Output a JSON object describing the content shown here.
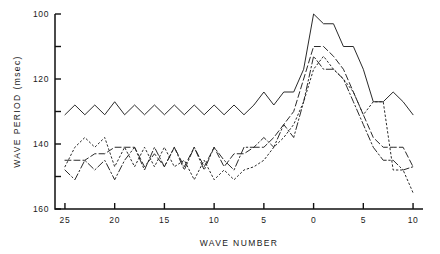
{
  "chart_data": {
    "type": "line",
    "title": "",
    "xlabel": "WAVE NUMBER",
    "ylabel": "WAVE PERIOD (msec)",
    "x_tick_labels": [
      "25",
      "20",
      "15",
      "10",
      "5",
      "0",
      "5",
      "10"
    ],
    "x_tick_values": [
      -25,
      -20,
      -15,
      -10,
      -5,
      0,
      5,
      10
    ],
    "xlim": [
      -26,
      11
    ],
    "y_tick_labels": [
      "100",
      "120",
      "140",
      "160"
    ],
    "y_tick_values": [
      100,
      120,
      140,
      160
    ],
    "y_minor_tick_values": [
      110,
      130,
      150
    ],
    "ylim": [
      100,
      160
    ],
    "y_axis_inverted": true,
    "grid": false,
    "legend": "none",
    "axis_style": "left-and-bottom-spine",
    "x": [
      -25,
      -24,
      -23,
      -22,
      -21,
      -20,
      -19,
      -18,
      -17,
      -16,
      -15,
      -14,
      -13,
      -12,
      -11,
      -10,
      -9,
      -8,
      -7,
      -6,
      -5,
      -4,
      -3,
      -2,
      -1,
      0,
      1,
      2,
      3,
      4,
      5,
      6,
      7,
      8,
      9,
      10
    ],
    "series": [
      {
        "name": "series-1",
        "style": "solid",
        "values": [
          131,
          128,
          131,
          128,
          131,
          127,
          131,
          128,
          131,
          128,
          131,
          128,
          131,
          128,
          131,
          128,
          131,
          128,
          131,
          128,
          124,
          128,
          124,
          124,
          117,
          100,
          103,
          103,
          110,
          110,
          117,
          127,
          127,
          124,
          127,
          131
        ]
      },
      {
        "name": "series-2",
        "style": "dashed",
        "values": [
          145,
          145,
          145,
          143,
          143,
          141,
          141,
          141,
          147,
          143,
          147,
          141,
          147,
          141,
          147,
          141,
          147,
          143,
          143,
          141,
          141,
          138,
          134,
          130,
          120,
          110,
          110,
          113,
          117,
          124,
          131,
          138,
          141,
          141,
          141,
          147
        ]
      },
      {
        "name": "series-3",
        "style": "dash-dot",
        "values": [
          148,
          151,
          145,
          148,
          145,
          151,
          145,
          141,
          148,
          141,
          147,
          141,
          148,
          141,
          148,
          141,
          145,
          148,
          141,
          141,
          138,
          141,
          134,
          138,
          127,
          113,
          117,
          117,
          120,
          127,
          134,
          141,
          145,
          145,
          148,
          147
        ]
      },
      {
        "name": "series-4",
        "style": "dotted",
        "values": [
          147,
          141,
          138,
          141,
          138,
          147,
          141,
          147,
          141,
          147,
          141,
          147,
          145,
          151,
          145,
          151,
          148,
          151,
          148,
          147,
          145,
          141,
          138,
          134,
          127,
          117,
          113,
          117,
          120,
          124,
          131,
          127,
          127,
          148,
          148,
          155
        ]
      }
    ]
  }
}
